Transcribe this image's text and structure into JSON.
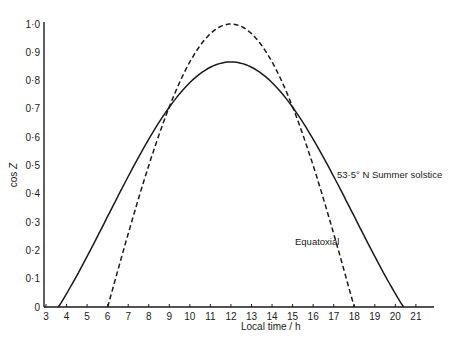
{
  "chart_data": {
    "type": "line",
    "title": "",
    "xlabel": "Local time / h",
    "ylabel": "cos Z",
    "xlim": [
      3,
      21.7
    ],
    "ylim": [
      0,
      1.0
    ],
    "grid": false,
    "legend": "inline annotations",
    "x_ticks": [
      3,
      4,
      5,
      6,
      7,
      8,
      9,
      10,
      11,
      12,
      13,
      14,
      15,
      16,
      17,
      18,
      19,
      20,
      21
    ],
    "y_ticks": [
      0,
      0.1,
      0.2,
      0.3,
      0.4,
      0.5,
      0.6,
      0.7,
      0.8,
      0.9,
      1.0
    ],
    "y_tick_labels": [
      "0",
      "0·1",
      "0·2",
      "0·3",
      "0·4",
      "0·5",
      "0·6",
      "0·7",
      "0·8",
      "0·9",
      "1·0"
    ],
    "series": [
      {
        "name": "53·5° N Summer solstice",
        "style": "solid",
        "x": [
          3.6,
          4,
          5,
          6,
          7,
          8,
          9,
          10,
          11,
          12,
          13,
          14,
          15,
          16,
          17,
          18,
          19,
          20,
          20.4
        ],
        "values": [
          0.0,
          0.04,
          0.18,
          0.32,
          0.46,
          0.59,
          0.71,
          0.79,
          0.85,
          0.87,
          0.85,
          0.79,
          0.71,
          0.59,
          0.46,
          0.32,
          0.18,
          0.04,
          0.0
        ]
      },
      {
        "name": "Equatoxial",
        "style": "dashed",
        "x": [
          6,
          7,
          8,
          9,
          10,
          11,
          12,
          13,
          14,
          15,
          16,
          17,
          18
        ],
        "values": [
          0.0,
          0.26,
          0.5,
          0.71,
          0.87,
          0.97,
          1.0,
          0.97,
          0.87,
          0.71,
          0.5,
          0.26,
          0.0
        ]
      }
    ],
    "annotations": [
      {
        "text": "53·5° N Summer solstice",
        "x": 17.0,
        "y": 0.53
      },
      {
        "text": "Equatoxial",
        "x": 14.3,
        "y": 0.28
      }
    ]
  },
  "labels": {
    "ylabel_main": "cos ",
    "ylabel_symbol": "Z",
    "xlabel": "Local time / h",
    "solstice": "53·5° N Summer solstice",
    "equatorial": "Equatoxial"
  }
}
